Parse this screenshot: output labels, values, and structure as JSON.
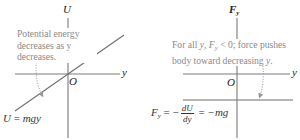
{
  "left_panel": {
    "vertical_axis_label": "U",
    "horizontal_axis_label": "y",
    "origin_label": "O",
    "note_lines": [
      "Potential energy",
      "decreases as y",
      "decreases."
    ],
    "curve_label": "U = mgy",
    "curve_label_parts": {
      "lhs": "U",
      "eq": "=",
      "rhs": "mgy"
    }
  },
  "right_panel": {
    "vertical_axis_label": "F",
    "vertical_axis_sub": "y",
    "horizontal_axis_label": "y",
    "origin_label": "O",
    "note_lines": [
      "For all y, F",
      "y",
      " < 0; force pushes",
      "body toward decreasing y."
    ],
    "note_parts": {
      "line1_pre": "For all ",
      "line1_var": "y",
      "line1_comma": ", ",
      "line1_F": "F",
      "line1_sub": "y",
      "line1_post": " < 0; force pushes",
      "line2_pre": "body toward decreasing ",
      "line2_var": "y",
      "line2_post": "."
    },
    "equation": {
      "lhs": "F",
      "lhs_sub": "y",
      "eq1": "=",
      "minus1": "−",
      "frac_num": "dU",
      "frac_den": "dy",
      "eq2": "=",
      "rhs": "−mg"
    }
  },
  "colors": {
    "axis": "#7a7a7a",
    "line": "#6e6e6e",
    "note_text": "#8a8a8a",
    "arrow": "#9a9a9a"
  }
}
